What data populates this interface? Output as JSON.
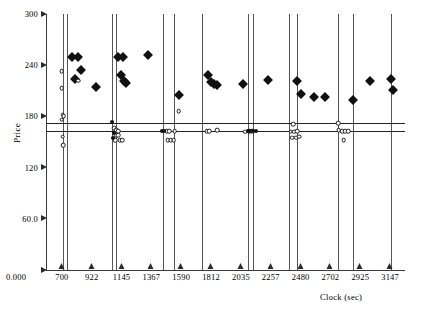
{
  "chart_data": {
    "type": "scatter",
    "title": "",
    "xlabel": "Clock (sec)",
    "ylabel": "Price",
    "xlim": [
      589,
      3258
    ],
    "ylim": [
      0,
      300
    ],
    "grid": false,
    "legend": "none",
    "y_ticks": [
      {
        "value": 300,
        "label": "300"
      },
      {
        "value": 240,
        "label": "240"
      },
      {
        "value": 180,
        "label": "180"
      },
      {
        "value": 120,
        "label": "120"
      },
      {
        "value": 60,
        "label": "60.0"
      },
      {
        "value": 0,
        "label": "0.000"
      }
    ],
    "x_ticks": [
      {
        "value": 700,
        "label": "700"
      },
      {
        "value": 922,
        "label": "922"
      },
      {
        "value": 1145,
        "label": "1145"
      },
      {
        "value": 1367,
        "label": "1367"
      },
      {
        "value": 1590,
        "label": "1590"
      },
      {
        "value": 1812,
        "label": "1812"
      },
      {
        "value": 2035,
        "label": "2035"
      },
      {
        "value": 2257,
        "label": "2257"
      },
      {
        "value": 2480,
        "label": "2480"
      },
      {
        "value": 2702,
        "label": "2702"
      },
      {
        "value": 2925,
        "label": "2925"
      },
      {
        "value": 3147,
        "label": "3147"
      }
    ],
    "reference_lines_y": [
      172,
      163
    ],
    "vertical_markers_x": [
      705,
      738,
      1075,
      1100,
      1455,
      1535,
      1745,
      2085,
      2125,
      2395,
      2450,
      2760,
      2870,
      3150
    ],
    "series": [
      {
        "name": "Ask (filled diamond)",
        "marker": "filled-diamond",
        "points": [
          {
            "x": 772,
            "y": 250
          },
          {
            "x": 822,
            "y": 250
          },
          {
            "x": 845,
            "y": 234
          },
          {
            "x": 800,
            "y": 224
          },
          {
            "x": 955,
            "y": 215
          },
          {
            "x": 1120,
            "y": 250
          },
          {
            "x": 1158,
            "y": 250
          },
          {
            "x": 1140,
            "y": 228
          },
          {
            "x": 1160,
            "y": 222
          },
          {
            "x": 1175,
            "y": 219
          },
          {
            "x": 1340,
            "y": 252
          },
          {
            "x": 1570,
            "y": 205
          },
          {
            "x": 1790,
            "y": 228
          },
          {
            "x": 1812,
            "y": 220
          },
          {
            "x": 1835,
            "y": 218
          },
          {
            "x": 1860,
            "y": 217
          },
          {
            "x": 2050,
            "y": 218
          },
          {
            "x": 2240,
            "y": 223
          },
          {
            "x": 2455,
            "y": 222
          },
          {
            "x": 2480,
            "y": 206
          },
          {
            "x": 2580,
            "y": 203
          },
          {
            "x": 2660,
            "y": 203
          },
          {
            "x": 2870,
            "y": 199
          },
          {
            "x": 3000,
            "y": 222
          },
          {
            "x": 3150,
            "y": 224
          },
          {
            "x": 3165,
            "y": 211
          }
        ]
      },
      {
        "name": "Bid (open circle)",
        "marker": "open-circle",
        "points": [
          {
            "x": 700,
            "y": 233
          },
          {
            "x": 700,
            "y": 213
          },
          {
            "x": 705,
            "y": 182
          },
          {
            "x": 715,
            "y": 180
          },
          {
            "x": 700,
            "y": 176
          },
          {
            "x": 705,
            "y": 156
          },
          {
            "x": 712,
            "y": 146
          },
          {
            "x": 820,
            "y": 222
          },
          {
            "x": 1090,
            "y": 166
          },
          {
            "x": 1105,
            "y": 164
          },
          {
            "x": 1118,
            "y": 163
          },
          {
            "x": 1105,
            "y": 158
          },
          {
            "x": 1122,
            "y": 158
          },
          {
            "x": 1098,
            "y": 152
          },
          {
            "x": 1130,
            "y": 152
          },
          {
            "x": 1148,
            "y": 152
          },
          {
            "x": 1570,
            "y": 186
          },
          {
            "x": 1480,
            "y": 163
          },
          {
            "x": 1500,
            "y": 163
          },
          {
            "x": 1540,
            "y": 163
          },
          {
            "x": 1490,
            "y": 152
          },
          {
            "x": 1512,
            "y": 152
          },
          {
            "x": 1535,
            "y": 152
          },
          {
            "x": 1780,
            "y": 163
          },
          {
            "x": 1800,
            "y": 163
          },
          {
            "x": 1860,
            "y": 164
          },
          {
            "x": 2065,
            "y": 162
          },
          {
            "x": 2095,
            "y": 163
          },
          {
            "x": 2120,
            "y": 163
          },
          {
            "x": 2425,
            "y": 171
          },
          {
            "x": 2405,
            "y": 162
          },
          {
            "x": 2430,
            "y": 162
          },
          {
            "x": 2455,
            "y": 163
          },
          {
            "x": 2415,
            "y": 155
          },
          {
            "x": 2445,
            "y": 155
          },
          {
            "x": 2470,
            "y": 156
          },
          {
            "x": 2760,
            "y": 172
          },
          {
            "x": 2765,
            "y": 164
          },
          {
            "x": 2790,
            "y": 163
          },
          {
            "x": 2812,
            "y": 163
          },
          {
            "x": 2835,
            "y": 163
          },
          {
            "x": 2800,
            "y": 152
          }
        ]
      },
      {
        "name": "Trade (small dot)",
        "marker": "dot",
        "points": [
          {
            "x": 1075,
            "y": 173
          },
          {
            "x": 1078,
            "y": 155
          },
          {
            "x": 1090,
            "y": 161
          },
          {
            "x": 1445,
            "y": 163
          },
          {
            "x": 1460,
            "y": 163
          },
          {
            "x": 2085,
            "y": 163
          },
          {
            "x": 2100,
            "y": 163
          },
          {
            "x": 2125,
            "y": 163
          },
          {
            "x": 2145,
            "y": 163
          }
        ]
      }
    ]
  }
}
